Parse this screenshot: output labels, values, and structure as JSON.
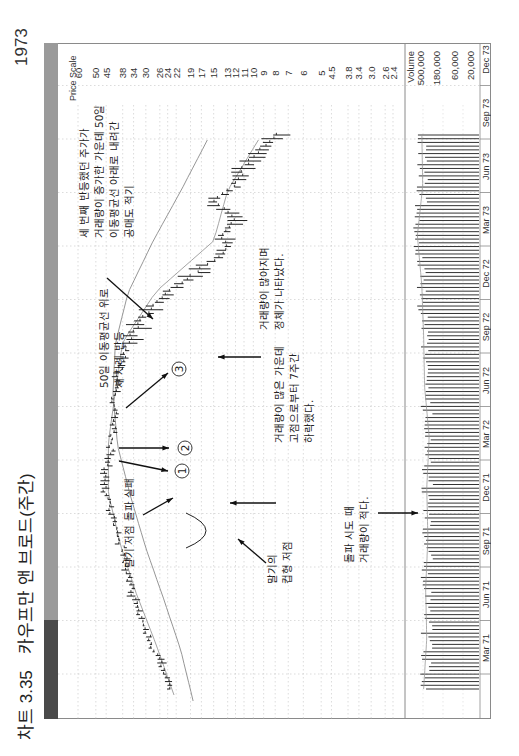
{
  "page": {
    "figure_number": "차트 3.35",
    "title": "카우프만 앤 브로드(주간)",
    "year_label": "1973"
  },
  "axis": {
    "price_scale_label": "Price Scale",
    "price_ticks": [
      "60",
      "50",
      "45",
      "38",
      "34",
      "30",
      "26",
      "24",
      "22",
      "19",
      "17",
      "15",
      "13",
      "12",
      "11",
      "10",
      "9",
      "8",
      "7",
      "6",
      "5",
      "4.5",
      "3.8",
      "3.4",
      "3.0",
      "2.6",
      "2.4"
    ],
    "volume_label": "Volume",
    "volume_ticks": [
      "500,000",
      "180,000",
      "60,000",
      "20,000"
    ],
    "time_ticks": [
      "Mar 71",
      "Jun 71",
      "Sep 71",
      "Dec 71",
      "Mar 72",
      "Jun 72",
      "Sep 72",
      "Dec 72",
      "Mar 73",
      "Jun 73",
      "Sep 73",
      "Dec 73"
    ]
  },
  "annotations": {
    "circle_1": "1",
    "circle_2": "2",
    "circle_3": "3",
    "ma_rally": [
      "50일 이동평균선 위로",
      "세 차례 반등"
    ],
    "third_rally": [
      "세 번째 반등했던 주가가",
      "거래량이 증가한 가운데 50일",
      "이동평균선 아래로 내려간",
      "공매도 적기"
    ],
    "breakout_fail": [
      "말기 저점 돌파 실패"
    ],
    "cup_low": [
      "말기의",
      "컵형 저점"
    ],
    "heavy_volume_drop": [
      "거래량이 많은 가운데",
      "고점으로부터 7주간",
      "하락했다."
    ],
    "churning": [
      "거래량이 많아지며",
      "정체가 나타났다."
    ],
    "low_volume_attempt": [
      "돌파 시도 때",
      "거래량이 적다."
    ]
  },
  "colors": {
    "stripe_light": "#9a9a9a",
    "stripe_dark": "#4a4a4a",
    "bars": "#222222",
    "ma_line": "#888888",
    "grid": "#b5b5b5",
    "frame": "#8a8a8a"
  },
  "chart_data": {
    "type": "bar",
    "subtype": "weekly OHLC price bars with moving averages and volume histogram (figure rotated 90° counterclockwise)",
    "title": "카우프만 앤 브로드(주간)",
    "figure_number": "차트 3.35",
    "xlabel": "",
    "ylabel": "Price Scale",
    "y_scale": "log",
    "ylim": [
      2.4,
      60
    ],
    "x_ticks": [
      "Mar 71",
      "Jun 71",
      "Sep 71",
      "Dec 71",
      "Mar 72",
      "Jun 72",
      "Sep 72",
      "Dec 72",
      "Mar 73",
      "Jun 73",
      "Sep 73",
      "Dec 73"
    ],
    "y_ticks": [
      60,
      50,
      45,
      38,
      34,
      30,
      26,
      24,
      22,
      19,
      17,
      15,
      13,
      12,
      11,
      10,
      9,
      8,
      7,
      6,
      5,
      4.5,
      3.8,
      3.4,
      3.0,
      2.6,
      2.4
    ],
    "grid": true,
    "series": [
      {
        "name": "Weekly price (approx. close)",
        "x": [
          "Mar 71",
          "Apr 71",
          "May 71",
          "Jun 71",
          "Jul 71",
          "Aug 71",
          "Sep 71",
          "Oct 71",
          "Nov 71",
          "Dec 71",
          "Jan 72",
          "Feb 72",
          "Mar 72",
          "Apr 72",
          "May 72",
          "Jun 72",
          "Jul 72",
          "Aug 72",
          "Sep 72",
          "Oct 72",
          "Nov 72",
          "Dec 72",
          "Jan 73",
          "Feb 73",
          "Mar 73",
          "Apr 73",
          "May 73",
          "Jun 73",
          "Jul 73",
          "Aug 73",
          "Sep 73",
          "Oct 73",
          "Nov 73",
          "Dec 73"
        ],
        "values": [
          23.5,
          25,
          27,
          29,
          31,
          33,
          35,
          37,
          37,
          40,
          42,
          44,
          46,
          45,
          43,
          42,
          41,
          42,
          41,
          39,
          37,
          35,
          31,
          27,
          22,
          17,
          13,
          14,
          12,
          15,
          12,
          11,
          9.5,
          8
        ]
      },
      {
        "name": "50-day moving average",
        "x": [
          "Mar 71",
          "Jun 71",
          "Sep 71",
          "Dec 71",
          "Mar 72",
          "Jun 72",
          "Sep 72",
          "Dec 72",
          "Mar 73",
          "Jun 73",
          "Sep 73",
          "Dec 73"
        ],
        "values": [
          22.5,
          27,
          33,
          39,
          44,
          44,
          41,
          38,
          27,
          15,
          13,
          9.5
        ]
      },
      {
        "name": "200-day moving average",
        "x": [
          "Mar 71",
          "Jun 71",
          "Sep 71",
          "Dec 71",
          "Mar 72",
          "Jun 72",
          "Sep 72",
          "Dec 72",
          "Mar 73",
          "Jun 73",
          "Sep 73",
          "Dec 73"
        ],
        "values": [
          18.5,
          21,
          25,
          30,
          35,
          40,
          42,
          41,
          36,
          28,
          21,
          16
        ]
      },
      {
        "name": "Weekly volume",
        "x": [
          "Mar 71",
          "Jun 71",
          "Sep 71",
          "Dec 71",
          "Mar 72",
          "Jun 72",
          "Sep 72",
          "Dec 72",
          "Mar 73",
          "Jun 73",
          "Sep 73",
          "Dec 73"
        ],
        "values": [
          180000,
          150000,
          160000,
          140000,
          150000,
          130000,
          170000,
          180000,
          200000,
          260000,
          190000,
          200000
        ]
      }
    ],
    "annotations": [
      {
        "marker": "1",
        "text": "50일 이동평균선 위로 세 차례 반등"
      },
      {
        "marker": "2",
        "text": "50일 이동평균선 위로 세 차례 반등"
      },
      {
        "marker": "3",
        "text": "세 번째 반등했던 주가가 거래량이 증가한 가운데 50일 이동평균선 아래로 내려간 공매도 적기"
      },
      {
        "text": "말기 저점 돌파 실패"
      },
      {
        "text": "말기의 컵형 저점"
      },
      {
        "text": "거래량이 많은 가운데 고점으로부터 7주간 하락했다."
      },
      {
        "text": "거래량이 많아지며 정체가 나타났다."
      },
      {
        "text": "돌파 시도 때 거래량이 적다."
      }
    ],
    "volume_ticks": [
      "500,000",
      "180,000",
      "60,000",
      "20,000"
    ],
    "legend": "none"
  }
}
